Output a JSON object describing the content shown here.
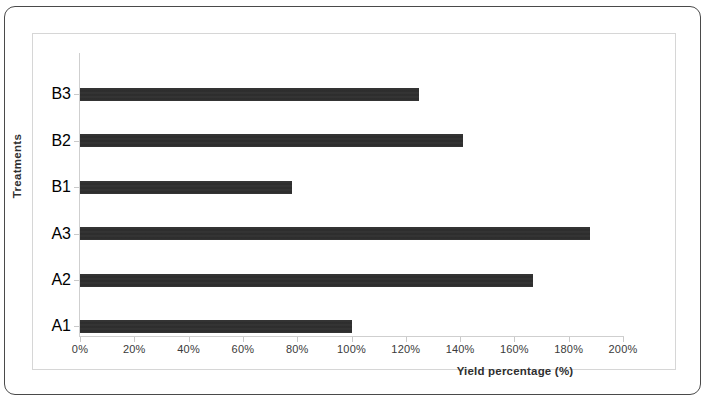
{
  "figure": {
    "border_color": "#4a4a4a",
    "plot_frame_color": "#d6d6d6",
    "bar_color": "#2b2b2b",
    "background": "#ffffff"
  },
  "chart_data": {
    "type": "bar",
    "orientation": "horizontal",
    "title": "",
    "subtitle": "",
    "xlabel": "Yield percentage (%)",
    "ylabel": "Treatments",
    "categories": [
      "A1",
      "A2",
      "A3",
      "B1",
      "B2",
      "B3"
    ],
    "values": [
      100,
      167,
      188,
      78,
      141,
      125
    ],
    "value_labels": [
      "100%",
      "167%",
      "188%",
      "78%",
      "141%",
      "125%"
    ],
    "xlim": [
      0,
      200
    ],
    "ylim": null,
    "xticks": [
      0,
      20,
      40,
      60,
      80,
      100,
      120,
      140,
      160,
      180,
      200
    ],
    "xtick_labels": [
      "0%",
      "20%",
      "40%",
      "60%",
      "80%",
      "100%",
      "120%",
      "140%",
      "160%",
      "180%",
      "200%"
    ],
    "ytick_labels_top_to_bottom": [
      "B3",
      "B2",
      "B1",
      "A3",
      "A2",
      "A1"
    ],
    "grid": false,
    "legend": null,
    "series": [
      {
        "name": "Yield percentage",
        "values": [
          100,
          167,
          188,
          78,
          141,
          125
        ]
      }
    ]
  }
}
